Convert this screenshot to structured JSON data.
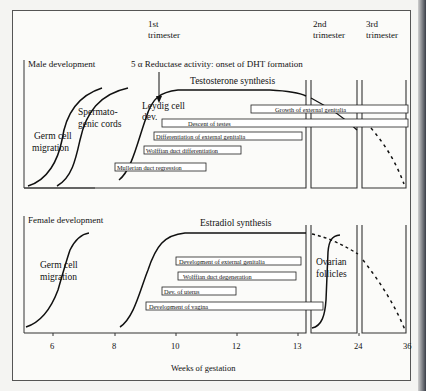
{
  "header": {
    "trimesters": [
      {
        "line1": "1st",
        "line2": "trimester"
      },
      {
        "line1": "2nd",
        "line2": "trimester"
      },
      {
        "line1": "3rd",
        "line2": "trimester"
      }
    ],
    "reductase_label": "5 α Reductase activity: onset of DHT formation"
  },
  "male": {
    "title": "Male development",
    "germ_cell_label": [
      "Germ cell",
      "migration"
    ],
    "cords_label": [
      "Spermato-",
      "genic cords"
    ],
    "leydig_label": [
      "Leydig cell",
      "dev."
    ],
    "synthesis_label": "Testosterone synthesis",
    "bars": [
      "Growth of external genitalia",
      "Descent of testes",
      "Differentiation of external genitalia",
      "Wolffian duct differentiation",
      "Mullerian duct regression"
    ]
  },
  "female": {
    "title": "Female development",
    "germ_cell_label": [
      "Germ cell",
      "migration"
    ],
    "synthesis_label": "Estradiol synthesis",
    "follicles_label": [
      "Ovarian",
      "follicles"
    ],
    "bars": [
      "Development of external genitalia",
      "Wolffian duct degeneration",
      "Dev. of uterus",
      "Development of vagina"
    ]
  },
  "axis": {
    "ticks": [
      "6",
      "8",
      "10",
      "12",
      "13",
      "24",
      "36"
    ],
    "xlabel": "Weeks of gestation"
  }
}
